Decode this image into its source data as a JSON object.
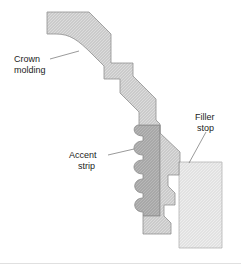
{
  "figure": {
    "background_color": "#ffffff",
    "width": 241,
    "height": 277
  },
  "colors": {
    "crown_molding_fill": "#c9c9c9",
    "crown_molding_stroke": "#8f8f8f",
    "accent_strip_fill": "#a6a6a6",
    "accent_strip_stroke": "#8a8a8a",
    "filler_stop_fill": "#e1e1e1",
    "filler_stop_stroke": "#b4b4b4",
    "leader_line": "#6f6f6f",
    "label_text": "#1b1b1b",
    "divider_rule": "#e0e0e0"
  },
  "labels": {
    "crown_molding": {
      "line1": "Crown",
      "line2": "molding"
    },
    "accent_strip": {
      "line1": "Accent",
      "line2": "strip"
    },
    "filler_stop": {
      "line1": "Filler",
      "line2": "stop"
    }
  },
  "parts": {
    "crown_molding_name": "crown-molding",
    "accent_strip_name": "accent-strip",
    "filler_stop_name": "filler-stop",
    "accent_scallop_count": 6
  }
}
